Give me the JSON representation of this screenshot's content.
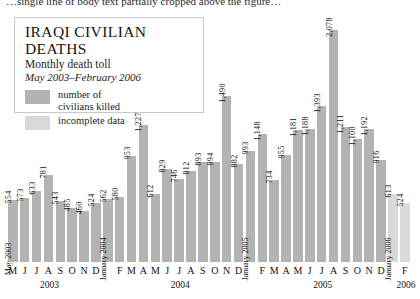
{
  "top_caption": "…single line of body text partially cropped above the figure…",
  "title": {
    "main": "IRAQI CIVILIAN DEATHS",
    "subtitle": "Monthly death toll",
    "daterange": "May 2003–February 2006"
  },
  "legend": {
    "items": [
      {
        "label_line1": "number of",
        "label_line2": "civilians killed",
        "color": "#b3b3b3",
        "key": "killed"
      },
      {
        "label_line1": "incomplete data",
        "label_line2": "",
        "color": "#d9d9d9",
        "key": "incomplete"
      }
    ]
  },
  "colors": {
    "bar_main": "#b3b3b3",
    "bar_incomplete": "#d9d9d9",
    "text": "#1a1a1a",
    "box_border": "#c9c9c9",
    "background": "#ffffff"
  },
  "axis": {
    "tick_labels": [
      "M",
      "J",
      "J",
      "A",
      "S",
      "O",
      "N",
      "D",
      "",
      "F",
      "M",
      "A",
      "M",
      "J",
      "J",
      "A",
      "S",
      "O",
      "N",
      "D",
      "",
      "F",
      "M",
      "A",
      "M",
      "J",
      "J",
      "A",
      "S",
      "O",
      "N",
      "D",
      "",
      "F"
    ],
    "year_labels": [
      {
        "text": "2003",
        "index": 3
      },
      {
        "text": "2004",
        "index": 14
      },
      {
        "text": "2005",
        "index": 26
      },
      {
        "text": "2006",
        "index": 33
      }
    ]
  },
  "inline_month_labels": [
    {
      "text": "May 2003",
      "index": 0
    },
    {
      "text": "January 2004",
      "index": 8
    },
    {
      "text": "January 2005",
      "index": 20
    },
    {
      "text": "January 2006",
      "index": 32
    }
  ],
  "chart_data": {
    "type": "bar",
    "title": "IRAQI CIVILIAN DEATHS",
    "subtitle": "Monthly death toll",
    "xlabel": "",
    "ylabel": "Monthly death toll",
    "ylim": [
      0,
      2078
    ],
    "grid": false,
    "legend_position": "top-left inside title box",
    "categories": [
      "May 2003",
      "Jun 2003",
      "Jul 2003",
      "Aug 2003",
      "Sep 2003",
      "Oct 2003",
      "Nov 2003",
      "Dec 2003",
      "Jan 2004",
      "Feb 2004",
      "Mar 2004",
      "Apr 2004",
      "May 2004",
      "Jun 2004",
      "Jul 2004",
      "Aug 2004",
      "Sep 2004",
      "Oct 2004",
      "Nov 2004",
      "Dec 2004",
      "Jan 2005",
      "Feb 2005",
      "Mar 2005",
      "Apr 2005",
      "May 2005",
      "Jun 2005",
      "Jul 2005",
      "Aug 2005",
      "Sep 2005",
      "Oct 2005",
      "Nov 2005",
      "Dec 2005",
      "Jan 2006",
      "Feb 2006"
    ],
    "values": [
      554,
      573,
      633,
      781,
      543,
      485,
      460,
      524,
      562,
      580,
      953,
      1227,
      612,
      829,
      746,
      812,
      893,
      894,
      1490,
      882,
      993,
      1148,
      734,
      955,
      1181,
      1188,
      1393,
      2078,
      1211,
      1100,
      1192,
      916,
      613,
      524
    ],
    "value_labels": [
      "554",
      "573",
      "633",
      "781",
      "543",
      "485",
      "460",
      "524",
      "562",
      "580",
      "953",
      "1,227",
      "612",
      "829",
      "746",
      "812",
      "893",
      "894",
      "1,490",
      "882",
      "993",
      "1,148",
      "734",
      "955",
      "1,181",
      "1,188",
      "1,393",
      "2,078",
      "1,211",
      "1,100",
      "1,192",
      "916",
      "613",
      "524"
    ],
    "series_key": [
      "killed",
      "killed",
      "killed",
      "killed",
      "killed",
      "killed",
      "killed",
      "killed",
      "killed",
      "killed",
      "killed",
      "killed",
      "killed",
      "killed",
      "killed",
      "killed",
      "killed",
      "killed",
      "killed",
      "killed",
      "killed",
      "killed",
      "killed",
      "killed",
      "killed",
      "killed",
      "killed",
      "killed",
      "killed",
      "killed",
      "killed",
      "killed",
      "incomplete",
      "incomplete"
    ]
  }
}
